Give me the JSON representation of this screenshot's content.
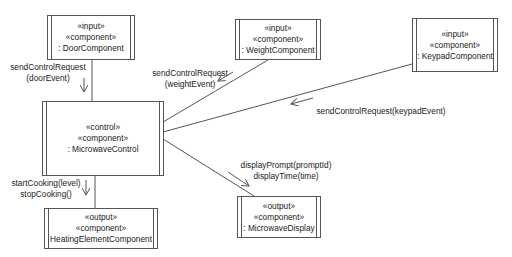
{
  "components": {
    "door": {
      "stereotypes": [
        "«input»",
        "«component»"
      ],
      "name": ": DoorComponent"
    },
    "weight": {
      "stereotypes": [
        "«input»",
        "«component»"
      ],
      "name": ": WeightComponent"
    },
    "keypad": {
      "stereotypes": [
        "«input»",
        "«component»"
      ],
      "name": ": KeypadComponent"
    },
    "control": {
      "stereotypes": [
        "«control»",
        "«component»"
      ],
      "name": ": MicrowaveControl"
    },
    "heating": {
      "stereotypes": [
        "«output»",
        "«component»"
      ],
      "name": "HeatingElementComponent"
    },
    "display": {
      "stereotypes": [
        "«output»",
        "«component»"
      ],
      "name": ": MicrowaveDisplay"
    }
  },
  "messages": {
    "door": [
      "sendControlRequest",
      "(doorEvent)"
    ],
    "weight": [
      "sendControlRequest",
      "(weightEvent)"
    ],
    "keypad": [
      "sendControlRequest(keypadEvent)"
    ],
    "heating": [
      "startCooking(level)",
      "stopCooking()"
    ],
    "display": [
      "displayPrompt(promptId)",
      "displayTime(time)"
    ]
  },
  "colors": {
    "line": "#555555",
    "text": "#222222",
    "background": "#ffffff"
  }
}
